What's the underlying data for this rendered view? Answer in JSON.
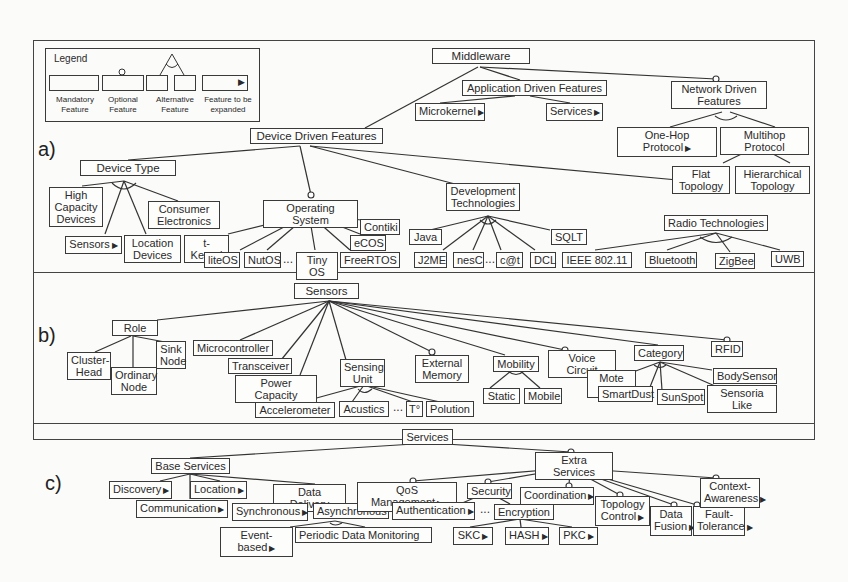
{
  "legend": {
    "title": "Legend",
    "items": [
      {
        "label": "Mandatory\nFeature"
      },
      {
        "label": "Optional\nFeature"
      },
      {
        "label": "Alternative\nFeature"
      },
      {
        "label": "Feature to be\nexpanded"
      }
    ]
  },
  "sections": {
    "a": {
      "label": "a)",
      "nodes": {
        "middleware": "Middleware",
        "app_driven": "Application Driven Features",
        "microkernel": "Microkernel",
        "services": "Services",
        "network_driven": "Network Driven\nFeatures",
        "one_hop": "One-Hop Protocol",
        "multihop": "Multihop Protocol",
        "flat": "Flat\nTopology",
        "hierarchical": "Hierarchical\nTopology",
        "device_driven": "Device Driven Features",
        "device_type": "Device Type",
        "high_capacity": "High\nCapacity\nDevices",
        "consumer": "Consumer\nElectronics",
        "sensors": "Sensors",
        "location": "Location\nDevices",
        "os": "Operating System",
        "contiki": "Contiki",
        "ecos": "eCOS",
        "tkernel": "t-Kernel",
        "liteos": "liteOS",
        "nutos": "NutOS",
        "tinyos": "Tiny OS",
        "freertos": "FreeRTOS",
        "dev_tech": "Development\nTechnologies",
        "java": "Java",
        "sqlt": "SQLT",
        "j2me": "J2ME",
        "nesc": "nesC",
        "cat": "c@t",
        "dcl": "DCL",
        "radio": "Radio Technologies",
        "ieee": "IEEE 802.11",
        "bluetooth": "Bluetooth",
        "zigbee": "ZigBee",
        "uwb": "UWB"
      }
    },
    "b": {
      "label": "b)",
      "nodes": {
        "sensors": "Sensors",
        "role": "Role",
        "cluster_head": "Cluster-\nHead",
        "ordinary": "Ordinary\nNode",
        "sink": "Sink\nNode",
        "microcontroller": "Microcontroller",
        "transceiver": "Transceiver",
        "power": "Power Capacity",
        "sensing_unit": "Sensing\nUnit",
        "accelerometer": "Accelerometer",
        "acustics": "Acustics",
        "temp": "T°",
        "polution": "Polution",
        "ext_memory": "External\nMemory",
        "mobility": "Mobility",
        "static": "Static",
        "mobile": "Mobile",
        "voice": "Voice Circuit",
        "category": "Category",
        "mote_like": "Mote Like",
        "smartdust": "SmartDust",
        "sunspot": "SunSpot",
        "bodysensor": "BodySensor",
        "sensoria": "Sensoria Like",
        "rfid": "RFID"
      }
    },
    "c": {
      "label": "c)",
      "nodes": {
        "services": "Services",
        "base": "Base Services",
        "discovery": "Discovery",
        "location": "Location",
        "data_delivery": "Data Delivery",
        "communication": "Communication",
        "synchronous": "Synchronous",
        "asynchronous": "Asynchronous",
        "event_based": "Event-based",
        "periodic": "Periodic Data Monitoring",
        "extra": "Extra Services",
        "qos": "QoS Management",
        "security": "Security",
        "authentication": "Authentication",
        "encryption": "Encryption",
        "skc": "SKC",
        "hash": "HASH",
        "pkc": "PKC",
        "coordination": "Coordination",
        "topology": "Topology\nControl",
        "data_fusion": "Data\nFusion",
        "fault": "Fault-\nTolerance",
        "context": "Context-\nAwareness"
      }
    }
  },
  "ellipsis": "..."
}
